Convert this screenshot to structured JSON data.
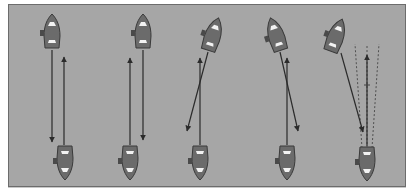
{
  "diagram": {
    "background_color": "#a6a6a6",
    "hull_color": "#6b6b6b",
    "line_color": "#2b2b2b",
    "scenarios": [
      {
        "id": 1,
        "description": "parallel courses, separated",
        "top_boat": {
          "x": 52,
          "y": 32,
          "angle": 0
        },
        "bottom_boat": {
          "x": 65,
          "y": 162,
          "angle": 0
        },
        "top_course": {
          "x1": 52,
          "y1": 50,
          "x2": 52,
          "y2": 142
        },
        "bottom_course": {
          "x1": 64,
          "y1": 145,
          "x2": 64,
          "y2": 57
        }
      },
      {
        "id": 2,
        "description": "parallel courses, closer",
        "top_boat": {
          "x": 143,
          "y": 32,
          "angle": 0
        },
        "bottom_boat": {
          "x": 130,
          "y": 162,
          "angle": 0
        },
        "top_course": {
          "x1": 143,
          "y1": 50,
          "x2": 143,
          "y2": 140
        },
        "bottom_course": {
          "x1": 130,
          "y1": 145,
          "x2": 130,
          "y2": 58
        }
      },
      {
        "id": 3,
        "description": "crossing courses, top boat heading left",
        "top_boat": {
          "x": 213,
          "y": 35,
          "angle": 18
        },
        "bottom_boat": {
          "x": 200,
          "y": 162,
          "angle": 0
        },
        "top_course": {
          "x1": 208,
          "y1": 52,
          "x2": 187,
          "y2": 131
        },
        "bottom_course": {
          "x1": 200,
          "y1": 145,
          "x2": 200,
          "y2": 58
        }
      },
      {
        "id": 4,
        "description": "crossing courses, top boat heading right",
        "top_boat": {
          "x": 276,
          "y": 35,
          "angle": -18
        },
        "bottom_boat": {
          "x": 287,
          "y": 162,
          "angle": 0
        },
        "top_course": {
          "x1": 280,
          "y1": 52,
          "x2": 298,
          "y2": 131
        },
        "bottom_course": {
          "x1": 287,
          "y1": 145,
          "x2": 287,
          "y2": 58
        }
      },
      {
        "id": 5,
        "description": "collision course with dashed bearing cone",
        "top_boat": {
          "x": 336,
          "y": 36,
          "angle": 20
        },
        "bottom_boat": {
          "x": 367,
          "y": 163,
          "angle": 0
        },
        "top_course": {
          "x1": 341,
          "y1": 53,
          "x2": 363,
          "y2": 132
        },
        "bottom_course": {
          "x1": 367,
          "y1": 146,
          "x2": 367,
          "y2": 55
        },
        "dashed_cone": true
      }
    ]
  }
}
